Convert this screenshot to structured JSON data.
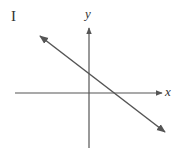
{
  "figure": {
    "panel_label": "I",
    "x_axis_label": "x",
    "y_axis_label": "y"
  },
  "colors": {
    "axis": "#555555",
    "line": "#555555",
    "text": "#333333"
  }
}
